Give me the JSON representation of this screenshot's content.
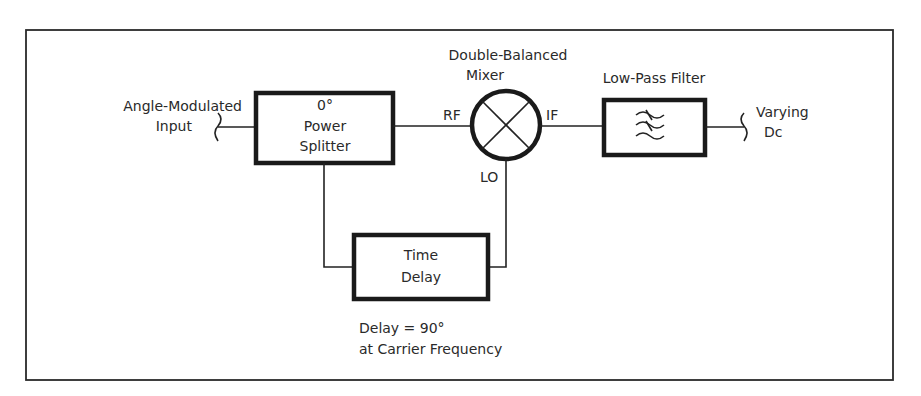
{
  "diagram": {
    "type": "block-diagram",
    "title": "",
    "input": {
      "label_line1": "Angle-Modulated",
      "label_line2": "Input"
    },
    "power_splitter": {
      "line1": "0°",
      "line2": "Power",
      "line3": "Splitter"
    },
    "mixer": {
      "label_line1": "Double-Balanced",
      "label_line2": "Mixer",
      "port_rf": "RF",
      "port_if": "IF",
      "port_lo": "LO"
    },
    "low_pass_filter": {
      "label": "Low-Pass Filter",
      "icon": "low-pass-filter-icon"
    },
    "output": {
      "label_line1": "Varying",
      "label_line2": "Dc"
    },
    "time_delay": {
      "line1": "Time",
      "line2": "Delay"
    },
    "delay_note": {
      "line1": "Delay = 90°",
      "line2": "at Carrier Frequency"
    },
    "connections": [
      {
        "from": "input",
        "to": "power_splitter"
      },
      {
        "from": "power_splitter",
        "to": "mixer.RF"
      },
      {
        "from": "power_splitter",
        "to": "time_delay"
      },
      {
        "from": "time_delay",
        "to": "mixer.LO"
      },
      {
        "from": "mixer.IF",
        "to": "low_pass_filter"
      },
      {
        "from": "low_pass_filter",
        "to": "output"
      }
    ],
    "colors": {
      "line": "#222222",
      "background": "#ffffff"
    }
  }
}
